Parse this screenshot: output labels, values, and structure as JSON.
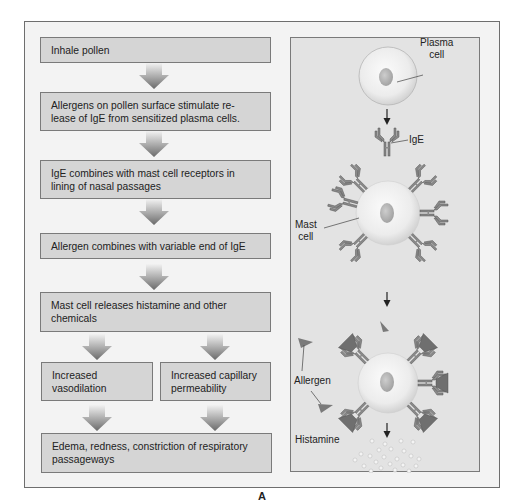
{
  "flowchart": {
    "steps": [
      {
        "id": "inhale",
        "text": "Inhale pollen"
      },
      {
        "id": "allergens-stimulate",
        "text": "Allergens on pollen surface stimulate re-\nlease of IgE from sensitized plasma cells."
      },
      {
        "id": "ige-combines",
        "text": "IgE combines with mast cell receptors in\nlining of nasal passages"
      },
      {
        "id": "allergen-combines",
        "text": "Allergen combines with variable end of IgE"
      },
      {
        "id": "mast-releases",
        "text": "Mast cell releases histamine and other\nchemicals"
      },
      {
        "id": "vasodilation",
        "text": "Increased\nvasodilation"
      },
      {
        "id": "permeability",
        "text": "Increased capillary\npermeability"
      },
      {
        "id": "edema",
        "text": "Edema, redness, constriction of respiratory\npassageways"
      }
    ]
  },
  "illustration": {
    "labels": {
      "plasma_cell": "Plasma\ncell",
      "ige": "IgE",
      "mast_cell": "Mast\ncell",
      "allergen": "Allergen",
      "histamine": "Histamine"
    }
  },
  "figure_label": "A",
  "colors": {
    "box_fill": "#d5d5d5",
    "box_border": "#7a7a7a",
    "panel_fill": "#e3e3e3",
    "frame_fill": "#f3f3f3",
    "arrow_dark": "#6a6a6a",
    "antibody": "#7d7d7d"
  }
}
